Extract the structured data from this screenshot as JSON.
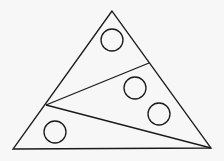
{
  "diagram": {
    "stroke": "#1a1a1a",
    "background": "#f7f7f7",
    "triangle": {
      "points": "112,11 13,149 211,148"
    },
    "dividers": [
      {
        "x1": 46,
        "y1": 105,
        "x2": 149,
        "y2": 63
      },
      {
        "x1": 46,
        "y1": 105,
        "x2": 211,
        "y2": 148
      }
    ],
    "circles": [
      {
        "cx": 112,
        "cy": 40,
        "r": 11
      },
      {
        "cx": 135,
        "cy": 88,
        "r": 11
      },
      {
        "cx": 159,
        "cy": 114,
        "r": 11
      },
      {
        "cx": 55,
        "cy": 132,
        "r": 11
      }
    ]
  }
}
